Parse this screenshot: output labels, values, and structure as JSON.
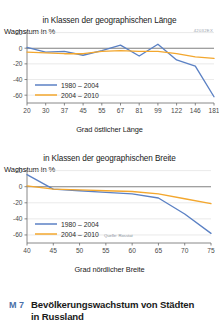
{
  "figure": {
    "caption_tag": "M 7",
    "caption_line1": "Bevölkerungswachstum von Städten",
    "caption_line2": "in Russland",
    "code_id": "42032EX",
    "source": "Quelle: Rosstat"
  },
  "colors": {
    "series_1980_2004": "#5b81c4",
    "series_2004_2010": "#f3a72e",
    "zero_line": "#808080",
    "grid": "#d9d9d9",
    "axis": "#6b6b6b",
    "tag": "#4a6fa8"
  },
  "chart_data": [
    {
      "type": "line",
      "title": "in Klassen der geographischen Länge",
      "ylabel": "Wachstum in %",
      "xlabel": "Grad östlicher Länge",
      "categories": [
        "20",
        "30",
        "37",
        "45",
        "55",
        "67",
        "81",
        "99",
        "122",
        "146",
        "181"
      ],
      "xticks": [
        20,
        30,
        37,
        45,
        55,
        67,
        81,
        99,
        122,
        146,
        181
      ],
      "yticks": [
        20,
        0,
        -20,
        -40,
        -60
      ],
      "ylim": [
        -70,
        22
      ],
      "grid": true,
      "legend_position": "bottom-left",
      "series": [
        {
          "name": "1980 – 2004",
          "color": "#5b81c4",
          "values": [
            1,
            -5,
            -4,
            -9,
            -3,
            4,
            -10,
            5,
            -15,
            -23,
            -62
          ]
        },
        {
          "name": "2004 – 2010",
          "color": "#f3a72e",
          "values": [
            -5,
            -6,
            -7,
            -7,
            -4,
            -3,
            -4,
            -4,
            -7,
            -11,
            -13
          ]
        }
      ]
    },
    {
      "type": "line",
      "title": "in Klassen der geographischen Breite",
      "ylabel": "Wachstum in %",
      "xlabel": "Grad nördlicher Breite",
      "categories": [
        "40",
        "45",
        "50",
        "55",
        "60",
        "65",
        "70",
        "75"
      ],
      "xticks": [
        40,
        45,
        50,
        55,
        60,
        65,
        70,
        75
      ],
      "yticks": [
        20,
        0,
        -20,
        -40,
        -60
      ],
      "ylim": [
        -70,
        22
      ],
      "grid": true,
      "legend_position": "bottom-left",
      "series": [
        {
          "name": "1980 – 2004",
          "color": "#5b81c4",
          "values": [
            15,
            -3,
            -5,
            -7,
            -9,
            -14,
            -34,
            -58
          ]
        },
        {
          "name": "2004 – 2010",
          "color": "#f3a72e",
          "values": [
            1,
            -3,
            -4,
            -5,
            -6,
            -9,
            -15,
            -21
          ]
        }
      ]
    }
  ]
}
